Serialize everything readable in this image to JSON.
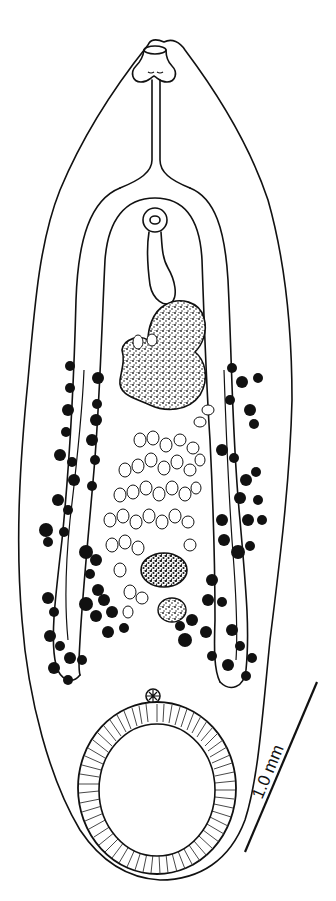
{
  "figure": {
    "colors": {
      "ink": "#111111",
      "background": "#ffffff"
    },
    "scale_bar": {
      "label": "1.0 mm",
      "x1": 245,
      "y1": 852,
      "x2": 317,
      "y2": 682
    },
    "structures": [
      "oral-sucker",
      "pharynx",
      "esophagus",
      "intestinal-caeca",
      "cirrus-sac",
      "genital-pore",
      "ovary",
      "testis-anterior",
      "testis-posterior",
      "uterus-eggs",
      "vitellaria-left",
      "vitellaria-right",
      "excretory-pore",
      "ventral-sucker",
      "tegument-outline"
    ]
  }
}
